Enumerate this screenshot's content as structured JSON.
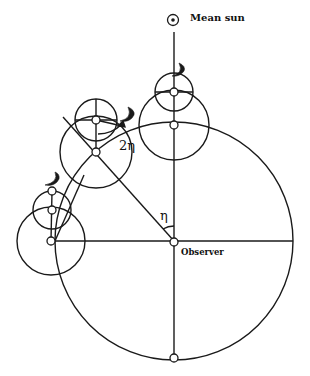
{
  "diagram": {
    "labels": {
      "mean_sun": "Mean sun",
      "observer": "Observer",
      "eta": "η",
      "two_eta": "2η"
    },
    "colors": {
      "stroke": "#1a1a1a",
      "background": "#ffffff"
    },
    "main_circle": {
      "cx": 174,
      "cy": 241,
      "r": 119
    },
    "epicycle_stacks": [
      {
        "name": "top",
        "big": {
          "cx": 174,
          "cy": 125,
          "r": 35
        },
        "small": {
          "cx": 174,
          "cy": 92,
          "r": 19
        }
      },
      {
        "name": "diagonal",
        "big": {
          "cx": 96,
          "cy": 152,
          "r": 36
        },
        "small": {
          "cx": 96,
          "cy": 120,
          "r": 21
        }
      },
      {
        "name": "left",
        "big": {
          "cx": 51,
          "cy": 241,
          "r": 34
        },
        "small": {
          "cx": 52,
          "cy": 210,
          "r": 19
        }
      }
    ]
  }
}
